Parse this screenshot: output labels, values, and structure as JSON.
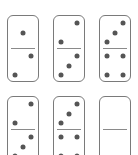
{
  "puzzle": {
    "description": "domino sequence",
    "colors": {
      "border": "#7a7a7a",
      "pip": "#555555",
      "background": "#ffffff"
    },
    "dominoes": [
      {
        "top": 1,
        "bottom": 2
      },
      {
        "top": 2,
        "bottom": 3
      },
      {
        "top": 3,
        "bottom": 4
      },
      {
        "top": 2,
        "bottom": 3
      },
      {
        "top": 3,
        "bottom": 4
      },
      {
        "top": 0,
        "bottom": 0
      }
    ]
  }
}
